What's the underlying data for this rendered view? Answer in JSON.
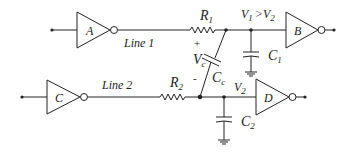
{
  "diagram": {
    "type": "circuit-schematic",
    "gates": [
      {
        "id": "A",
        "label": "A",
        "type": "inverter"
      },
      {
        "id": "B",
        "label": "B",
        "type": "inverter"
      },
      {
        "id": "C",
        "label": "C",
        "type": "inverter"
      },
      {
        "id": "D",
        "label": "D",
        "type": "inverter"
      }
    ],
    "lines": {
      "line1": "Line 1",
      "line2": "Line 2"
    },
    "components": {
      "r1": {
        "main": "R",
        "sub": "1"
      },
      "r2": {
        "main": "R",
        "sub": "2"
      },
      "c1": {
        "main": "C",
        "sub": "1"
      },
      "c2": {
        "main": "C",
        "sub": "2"
      },
      "cc": {
        "main": "C",
        "sub": "c"
      },
      "vc": {
        "main": "V",
        "sub": "c"
      }
    },
    "voltages": {
      "v1_gt_v2": {
        "v": "V",
        "s1": "1",
        "op": ">",
        "s2": "2"
      },
      "v2": {
        "main": "V",
        "sub": "2"
      }
    },
    "polarity": {
      "plus": "+",
      "minus": "-"
    }
  }
}
